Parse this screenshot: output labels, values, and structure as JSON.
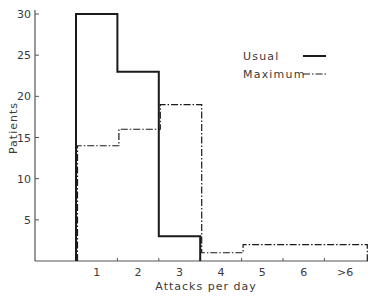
{
  "chart_data": {
    "type": "bar",
    "subtype": "step-histogram",
    "title": "",
    "xlabel": "Attacks per day",
    "ylabel": "Patients",
    "categories": [
      "1",
      "2",
      "3",
      "4",
      "5",
      "6",
      ">6"
    ],
    "series": [
      {
        "name": "Usual",
        "line_style": "solid",
        "values": [
          30,
          23,
          3,
          0,
          0,
          0,
          0
        ]
      },
      {
        "name": "Maximum",
        "line_style": "dash-dot",
        "values": [
          14,
          16,
          19,
          1,
          2,
          2,
          2
        ]
      }
    ],
    "ylim": [
      0,
      30
    ],
    "yticks": [
      5,
      10,
      15,
      20,
      25,
      30
    ],
    "grid": false,
    "legend_position": "upper right"
  },
  "legend": {
    "items": [
      {
        "label": "Usual",
        "style": "solid"
      },
      {
        "label": "Maximum",
        "style": "dash-dot"
      }
    ]
  },
  "colors": {
    "line": "#1a1a1a",
    "axis": "#555555",
    "text": "#3a3a3a"
  }
}
